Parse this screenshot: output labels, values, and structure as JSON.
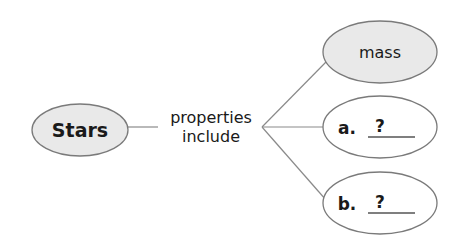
{
  "diagram": {
    "type": "concept-map",
    "root": {
      "label": "Stars"
    },
    "connector": {
      "line1": "properties",
      "line2": "include"
    },
    "children": [
      {
        "label": "mass",
        "filled": true
      },
      {
        "prefix": "a.",
        "blank": "?",
        "filled": false
      },
      {
        "prefix": "b.",
        "blank": "?",
        "filled": false
      }
    ]
  }
}
